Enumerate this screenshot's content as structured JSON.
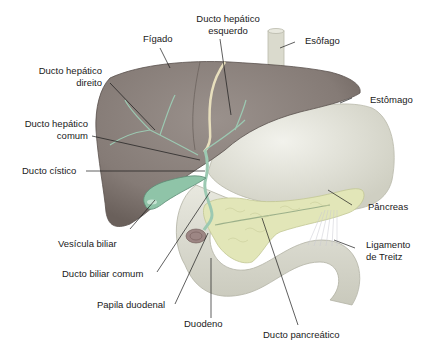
{
  "diagram": {
    "colors": {
      "liver": "#8a807b",
      "liver_dark": "#6c625e",
      "bile_duct": "#9cc9b2",
      "gallbladder": "#8fc4a8",
      "stomach": "#e6e6dc",
      "pancreas": "#e2e6b8",
      "esophagus": "#dcdcd0",
      "hepatic_duct_left": "#e8dfbd"
    },
    "labels": {
      "figado": "Fígado",
      "ducto_hepatico_esquerdo_1": "Ducto hepático",
      "ducto_hepatico_esquerdo_2": "esquerdo",
      "esofago": "Esôfago",
      "ducto_hepatico_direito_1": "Ducto hepático",
      "ducto_hepatico_direito_2": "direito",
      "estomago": "Estômago",
      "ducto_hepatico_comum_1": "Ducto hepático",
      "ducto_hepatico_comum_2": "comum",
      "ducto_cistico": "Ducto cístico",
      "pancreas": "Pâncreas",
      "vesicula_biliar": "Vesícula biliar",
      "ligamento_treitz_1": "Ligamento",
      "ligamento_treitz_2": "de Treitz",
      "ducto_biliar_comum": "Ducto biliar comum",
      "papila_duodenal": "Papila duodenal",
      "duodeno": "Duodeno",
      "ducto_pancreatico": "Ducto pancreático"
    }
  }
}
